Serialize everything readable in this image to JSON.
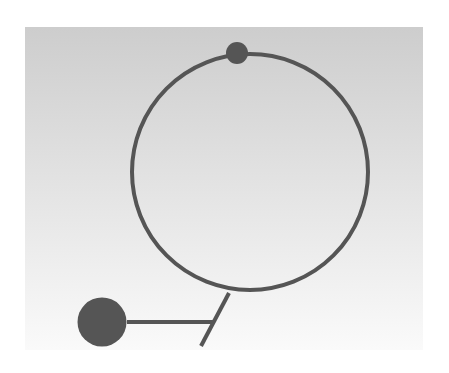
{
  "diagram": {
    "canvas": {
      "width": 449,
      "height": 373,
      "background": "#ffffff"
    },
    "panel": {
      "x": 25,
      "y": 27,
      "width": 398,
      "height": 323,
      "gradient_top": "#cdcdcd",
      "gradient_bottom": "#fafafa"
    },
    "stroke_color": "#555555",
    "fill_color": "#555555",
    "shapes": {
      "ring": {
        "cx": 250,
        "cy": 172,
        "r": 118,
        "stroke_width": 4
      },
      "top_node": {
        "cx": 237,
        "cy": 53,
        "r": 11
      },
      "stem": {
        "x1": 229,
        "y1": 293,
        "x2": 201,
        "y2": 346,
        "stroke_width": 4
      },
      "connector": {
        "x1": 127,
        "y1": 322,
        "x2": 213,
        "y2": 322,
        "stroke_width": 4
      },
      "base_node": {
        "cx": 102,
        "cy": 322,
        "r": 24.5
      }
    }
  }
}
